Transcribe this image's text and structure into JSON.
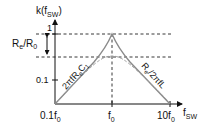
{
  "diagram": {
    "y_axis_label": {
      "main": "k(f",
      "sub": "SW",
      "close": ")"
    },
    "x_axis_label": {
      "main": "f",
      "sub": "SW"
    },
    "y_ticks": [
      {
        "label": "1",
        "level": "peak"
      },
      {
        "label": "0.1",
        "level": "low"
      }
    ],
    "x_ticks": [
      {
        "main": "0.1f",
        "sub": "0"
      },
      {
        "main": "f",
        "sub": "0"
      },
      {
        "main": "10f",
        "sub": "0"
      }
    ],
    "ratio_annotation": {
      "main": "R",
      "sub1": "e",
      "mid": "/R",
      "sub2": "0"
    },
    "left_slope_label": {
      "main": "2πfR",
      "sub1": "e",
      "mid": "C",
      "sub2": "1"
    },
    "right_slope_label": {
      "main": "R",
      "sub1": "e",
      "mid": "/2πfL"
    },
    "colors": {
      "axis": "#111111",
      "curve": "#8a8a8a",
      "dashed_curve": "#9a9a9a",
      "guide": "#222222"
    }
  }
}
